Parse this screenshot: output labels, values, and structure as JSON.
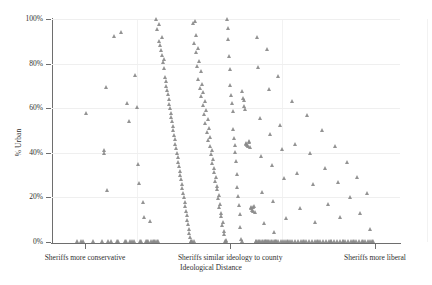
{
  "chart_data": {
    "type": "scatter",
    "title": "",
    "xlabel": "Ideological Distance",
    "ylabel": "% Urban",
    "xlim": [
      0,
      1
    ],
    "ylim": [
      0,
      100
    ],
    "grid": "horizontal-and-vertical-light",
    "legend": "none",
    "marker": {
      "shape": "triangle",
      "color": "#8a8a8a",
      "size_px": 5
    },
    "y_ticks": [
      {
        "value": 0,
        "label": "0%"
      },
      {
        "value": 20,
        "label": "20%"
      },
      {
        "value": 40,
        "label": "40%"
      },
      {
        "value": 60,
        "label": "60%"
      },
      {
        "value": 80,
        "label": "80%"
      },
      {
        "value": 100,
        "label": "100%"
      }
    ],
    "x_ticks": [
      {
        "position": 0.095,
        "label": "Sheriffs more conservative"
      },
      {
        "position": 0.512,
        "label": "Sheriffs similar ideology to county"
      },
      {
        "position": 0.928,
        "label": "Sheriffs more liberal"
      }
    ],
    "points": [
      [
        0.072,
        0.5
      ],
      [
        0.085,
        0.6
      ],
      [
        0.09,
        0.4
      ],
      [
        0.098,
        57.8
      ],
      [
        0.118,
        0.3
      ],
      [
        0.15,
        41.0
      ],
      [
        0.152,
        40.0
      ],
      [
        0.155,
        69.5
      ],
      [
        0.158,
        23.2
      ],
      [
        0.162,
        0.5
      ],
      [
        0.178,
        92.5
      ],
      [
        0.188,
        0.4
      ],
      [
        0.2,
        94.0
      ],
      [
        0.21,
        0.6
      ],
      [
        0.218,
        62.2
      ],
      [
        0.222,
        54.0
      ],
      [
        0.226,
        0.5
      ],
      [
        0.232,
        0.4
      ],
      [
        0.24,
        75.0
      ],
      [
        0.244,
        60.5
      ],
      [
        0.248,
        35.0
      ],
      [
        0.252,
        26.5
      ],
      [
        0.255,
        0.5
      ],
      [
        0.258,
        0.3
      ],
      [
        0.262,
        18.0
      ],
      [
        0.266,
        11.0
      ],
      [
        0.27,
        0.5
      ],
      [
        0.274,
        0.4
      ],
      [
        0.278,
        0.6
      ],
      [
        0.282,
        9.5
      ],
      [
        0.286,
        0.5
      ],
      [
        0.3,
        100.0
      ],
      [
        0.304,
        95.5
      ],
      [
        0.308,
        97.5
      ],
      [
        0.31,
        90.0
      ],
      [
        0.312,
        88.5
      ],
      [
        0.314,
        86.0
      ],
      [
        0.316,
        92.0
      ],
      [
        0.318,
        84.0
      ],
      [
        0.32,
        80.5
      ],
      [
        0.322,
        78.0
      ],
      [
        0.324,
        82.0
      ],
      [
        0.326,
        74.0
      ],
      [
        0.328,
        72.0
      ],
      [
        0.33,
        70.0
      ],
      [
        0.332,
        68.0
      ],
      [
        0.334,
        66.5
      ],
      [
        0.336,
        64.0
      ],
      [
        0.338,
        62.0
      ],
      [
        0.34,
        60.0
      ],
      [
        0.342,
        58.0
      ],
      [
        0.344,
        56.0
      ],
      [
        0.346,
        54.0
      ],
      [
        0.348,
        52.0
      ],
      [
        0.35,
        50.0
      ],
      [
        0.352,
        48.0
      ],
      [
        0.354,
        46.0
      ],
      [
        0.356,
        44.0
      ],
      [
        0.358,
        42.0
      ],
      [
        0.36,
        40.0
      ],
      [
        0.362,
        38.0
      ],
      [
        0.364,
        36.0
      ],
      [
        0.366,
        34.0
      ],
      [
        0.368,
        32.0
      ],
      [
        0.37,
        30.0
      ],
      [
        0.372,
        28.0
      ],
      [
        0.374,
        26.0
      ],
      [
        0.376,
        24.0
      ],
      [
        0.378,
        22.0
      ],
      [
        0.38,
        20.0
      ],
      [
        0.382,
        18.0
      ],
      [
        0.384,
        16.0
      ],
      [
        0.386,
        14.0
      ],
      [
        0.388,
        12.0
      ],
      [
        0.39,
        10.0
      ],
      [
        0.392,
        8.0
      ],
      [
        0.394,
        6.0
      ],
      [
        0.396,
        4.0
      ],
      [
        0.398,
        2.0
      ],
      [
        0.4,
        0.5
      ],
      [
        0.406,
        98.0
      ],
      [
        0.41,
        89.0
      ],
      [
        0.414,
        85.0
      ],
      [
        0.418,
        79.0
      ],
      [
        0.422,
        73.0
      ],
      [
        0.426,
        69.0
      ],
      [
        0.43,
        65.5
      ],
      [
        0.434,
        61.5
      ],
      [
        0.438,
        57.5
      ],
      [
        0.442,
        53.5
      ],
      [
        0.446,
        49.5
      ],
      [
        0.45,
        45.5
      ],
      [
        0.454,
        43.0
      ],
      [
        0.458,
        39.5
      ],
      [
        0.462,
        35.5
      ],
      [
        0.466,
        31.5
      ],
      [
        0.47,
        27.5
      ],
      [
        0.474,
        23.5
      ],
      [
        0.478,
        19.5
      ],
      [
        0.482,
        15.5
      ],
      [
        0.486,
        11.5
      ],
      [
        0.49,
        7.5
      ],
      [
        0.494,
        3.5
      ],
      [
        0.498,
        0.6
      ],
      [
        0.412,
        99.0
      ],
      [
        0.416,
        93.0
      ],
      [
        0.42,
        87.0
      ],
      [
        0.424,
        81.0
      ],
      [
        0.428,
        76.5
      ],
      [
        0.432,
        71.0
      ],
      [
        0.436,
        67.0
      ],
      [
        0.44,
        63.0
      ],
      [
        0.444,
        59.0
      ],
      [
        0.448,
        55.0
      ],
      [
        0.452,
        51.0
      ],
      [
        0.456,
        47.0
      ],
      [
        0.46,
        41.0
      ],
      [
        0.464,
        37.0
      ],
      [
        0.468,
        33.0
      ],
      [
        0.472,
        29.0
      ],
      [
        0.476,
        25.0
      ],
      [
        0.48,
        21.0
      ],
      [
        0.484,
        17.0
      ],
      [
        0.488,
        13.0
      ],
      [
        0.492,
        9.0
      ],
      [
        0.496,
        5.0
      ],
      [
        0.5,
        1.0
      ],
      [
        0.504,
        100.0
      ],
      [
        0.506,
        96.0
      ],
      [
        0.508,
        91.0
      ],
      [
        0.51,
        83.5
      ],
      [
        0.512,
        77.5
      ],
      [
        0.514,
        70.5
      ],
      [
        0.516,
        66.0
      ],
      [
        0.518,
        62.5
      ],
      [
        0.52,
        58.5
      ],
      [
        0.522,
        50.5
      ],
      [
        0.524,
        46.5
      ],
      [
        0.526,
        43.5
      ],
      [
        0.528,
        40.5
      ],
      [
        0.53,
        36.5
      ],
      [
        0.532,
        30.5
      ],
      [
        0.534,
        24.5
      ],
      [
        0.536,
        20.5
      ],
      [
        0.538,
        16.5
      ],
      [
        0.54,
        12.5
      ],
      [
        0.542,
        6.5
      ],
      [
        0.544,
        1.5
      ],
      [
        0.546,
        0.4
      ],
      [
        0.548,
        67.5
      ],
      [
        0.55,
        64.5
      ],
      [
        0.552,
        63.5
      ],
      [
        0.554,
        61.0
      ],
      [
        0.556,
        59.5
      ],
      [
        0.558,
        44.5
      ],
      [
        0.56,
        44.0
      ],
      [
        0.562,
        43.5
      ],
      [
        0.564,
        43.0
      ],
      [
        0.566,
        44.8
      ],
      [
        0.568,
        45.2
      ],
      [
        0.57,
        42.5
      ],
      [
        0.572,
        15.5
      ],
      [
        0.574,
        15.0
      ],
      [
        0.576,
        14.5
      ],
      [
        0.578,
        14.0
      ],
      [
        0.58,
        15.8
      ],
      [
        0.582,
        16.2
      ],
      [
        0.584,
        13.5
      ],
      [
        0.586,
        0.5
      ],
      [
        0.59,
        92.0
      ],
      [
        0.594,
        78.5
      ],
      [
        0.598,
        55.5
      ],
      [
        0.602,
        38.5
      ],
      [
        0.606,
        22.5
      ],
      [
        0.61,
        8.5
      ],
      [
        0.614,
        0.4
      ],
      [
        0.62,
        86.5
      ],
      [
        0.624,
        68.5
      ],
      [
        0.628,
        48.5
      ],
      [
        0.632,
        34.5
      ],
      [
        0.636,
        18.5
      ],
      [
        0.64,
        4.5
      ],
      [
        0.644,
        0.6
      ],
      [
        0.65,
        74.5
      ],
      [
        0.656,
        52.5
      ],
      [
        0.662,
        41.5
      ],
      [
        0.668,
        28.5
      ],
      [
        0.674,
        10.5
      ],
      [
        0.68,
        0.5
      ],
      [
        0.69,
        63.0
      ],
      [
        0.698,
        44.0
      ],
      [
        0.706,
        31.0
      ],
      [
        0.714,
        15.0
      ],
      [
        0.722,
        0.5
      ],
      [
        0.734,
        57.0
      ],
      [
        0.742,
        40.0
      ],
      [
        0.75,
        26.0
      ],
      [
        0.758,
        9.0
      ],
      [
        0.766,
        0.4
      ],
      [
        0.778,
        50.0
      ],
      [
        0.786,
        33.0
      ],
      [
        0.794,
        17.0
      ],
      [
        0.802,
        0.5
      ],
      [
        0.814,
        43.0
      ],
      [
        0.822,
        27.0
      ],
      [
        0.83,
        11.0
      ],
      [
        0.838,
        0.6
      ],
      [
        0.85,
        36.0
      ],
      [
        0.858,
        20.0
      ],
      [
        0.866,
        0.5
      ],
      [
        0.878,
        29.0
      ],
      [
        0.886,
        13.0
      ],
      [
        0.894,
        0.4
      ],
      [
        0.906,
        22.0
      ],
      [
        0.914,
        6.0
      ],
      [
        0.922,
        0.5
      ],
      [
        0.145,
        0.4
      ],
      [
        0.17,
        0.5
      ],
      [
        0.192,
        0.3
      ],
      [
        0.215,
        0.6
      ],
      [
        0.236,
        0.4
      ],
      [
        0.29,
        0.5
      ],
      [
        0.294,
        0.3
      ],
      [
        0.298,
        0.6
      ],
      [
        0.302,
        0.4
      ],
      [
        0.306,
        0.5
      ],
      [
        0.402,
        0.3
      ],
      [
        0.404,
        0.6
      ],
      [
        0.408,
        0.4
      ],
      [
        0.502,
        0.5
      ],
      [
        0.588,
        0.3
      ],
      [
        0.592,
        0.6
      ],
      [
        0.596,
        0.4
      ],
      [
        0.6,
        0.5
      ],
      [
        0.604,
        0.3
      ],
      [
        0.608,
        0.6
      ],
      [
        0.612,
        0.4
      ],
      [
        0.616,
        0.5
      ],
      [
        0.618,
        0.3
      ],
      [
        0.622,
        0.6
      ],
      [
        0.626,
        0.4
      ],
      [
        0.63,
        0.5
      ],
      [
        0.634,
        0.3
      ],
      [
        0.638,
        0.6
      ],
      [
        0.642,
        0.4
      ],
      [
        0.646,
        0.5
      ],
      [
        0.652,
        0.3
      ],
      [
        0.658,
        0.6
      ],
      [
        0.664,
        0.4
      ],
      [
        0.67,
        0.5
      ],
      [
        0.676,
        0.3
      ],
      [
        0.684,
        0.6
      ],
      [
        0.692,
        0.4
      ],
      [
        0.7,
        0.5
      ],
      [
        0.708,
        0.3
      ],
      [
        0.716,
        0.6
      ],
      [
        0.724,
        0.4
      ],
      [
        0.732,
        0.5
      ],
      [
        0.74,
        0.3
      ],
      [
        0.748,
        0.6
      ],
      [
        0.756,
        0.4
      ],
      [
        0.764,
        0.5
      ],
      [
        0.772,
        0.3
      ],
      [
        0.78,
        0.6
      ],
      [
        0.788,
        0.4
      ],
      [
        0.796,
        0.5
      ],
      [
        0.804,
        0.3
      ],
      [
        0.812,
        0.6
      ],
      [
        0.82,
        0.4
      ],
      [
        0.828,
        0.5
      ],
      [
        0.836,
        0.3
      ],
      [
        0.844,
        0.6
      ],
      [
        0.852,
        0.4
      ],
      [
        0.86,
        0.5
      ],
      [
        0.868,
        0.3
      ],
      [
        0.876,
        0.6
      ],
      [
        0.884,
        0.4
      ],
      [
        0.892,
        0.5
      ],
      [
        0.9,
        0.3
      ],
      [
        0.908,
        0.6
      ],
      [
        0.916,
        0.4
      ],
      [
        0.924,
        0.5
      ]
    ]
  }
}
